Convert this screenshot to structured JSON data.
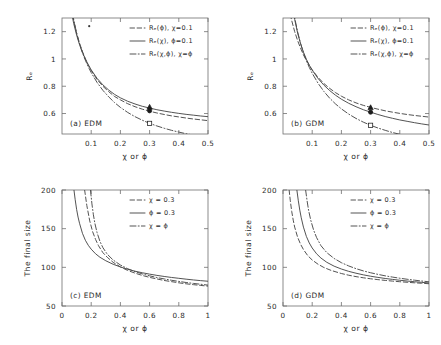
{
  "figure": {
    "layout": "2x2 grid of line plots",
    "panels": [
      "a",
      "b",
      "c",
      "d"
    ]
  },
  "chart_data": [
    {
      "type": "line",
      "panel": "a",
      "title": "(a) EDM",
      "xlabel": "χ or ϕ",
      "ylabel": "Rₑ",
      "xlim": [
        0,
        0.5
      ],
      "ylim": [
        0.45,
        1.3
      ],
      "xticks": [
        0.1,
        0.2,
        0.3,
        0.4,
        0.5
      ],
      "xtick_labels": [
        "0.1",
        "0.2",
        "0.3",
        "0.4",
        "0.5"
      ],
      "yticks": [
        0.6,
        0.8,
        1,
        1.2
      ],
      "ytick_labels": [
        "0.6",
        "0.8",
        "1",
        "1.2"
      ],
      "grid": false,
      "legend_position": "upper right",
      "series": [
        {
          "name": "Rₑ(ϕ), χ=0.1",
          "style": "dashed",
          "x": [
            0.01,
            0.02,
            0.03,
            0.04,
            0.05,
            0.06,
            0.07,
            0.08,
            0.09,
            0.1,
            0.12,
            0.14,
            0.16,
            0.18,
            0.2,
            0.225,
            0.25,
            0.275,
            0.3,
            0.325,
            0.35,
            0.375,
            0.4,
            0.425,
            0.45,
            0.475,
            0.5
          ],
          "y": [
            1.78,
            1.56,
            1.4,
            1.28,
            1.19,
            1.115,
            1.055,
            1.0,
            0.955,
            0.915,
            0.85,
            0.8,
            0.76,
            0.725,
            0.7,
            0.672,
            0.65,
            0.632,
            0.617,
            0.604,
            0.593,
            0.583,
            0.575,
            0.567,
            0.56,
            0.554,
            0.548
          ]
        },
        {
          "name": "Rₑ(χ), ϕ=0.1",
          "style": "solid",
          "x": [
            0.01,
            0.02,
            0.03,
            0.04,
            0.05,
            0.06,
            0.07,
            0.08,
            0.09,
            0.1,
            0.12,
            0.14,
            0.16,
            0.18,
            0.2,
            0.225,
            0.25,
            0.275,
            0.3,
            0.325,
            0.35,
            0.375,
            0.4,
            0.425,
            0.45,
            0.475,
            0.5
          ],
          "y": [
            1.72,
            1.52,
            1.37,
            1.26,
            1.175,
            1.105,
            1.048,
            1.0,
            0.958,
            0.92,
            0.858,
            0.81,
            0.772,
            0.74,
            0.715,
            0.69,
            0.67,
            0.653,
            0.64,
            0.628,
            0.618,
            0.609,
            0.601,
            0.594,
            0.588,
            0.582,
            0.577
          ]
        },
        {
          "name": "Rₑ(χ,ϕ), χ=ϕ",
          "style": "dashdot",
          "x": [
            0.01,
            0.02,
            0.03,
            0.04,
            0.05,
            0.06,
            0.07,
            0.08,
            0.09,
            0.1,
            0.12,
            0.14,
            0.16,
            0.18,
            0.2,
            0.225,
            0.25,
            0.275,
            0.3,
            0.325,
            0.35,
            0.375,
            0.4,
            0.425,
            0.45,
            0.475,
            0.5
          ],
          "y": [
            1.83,
            1.59,
            1.42,
            1.29,
            1.19,
            1.11,
            1.045,
            0.99,
            0.942,
            0.9,
            0.828,
            0.77,
            0.722,
            0.68,
            0.645,
            0.608,
            0.577,
            0.551,
            0.528,
            0.509,
            0.492,
            0.477,
            0.464,
            0.452,
            0.442,
            0.433,
            0.424
          ]
        }
      ],
      "markers": [
        {
          "shape": "triangle",
          "fill": "filled",
          "x": 0.3,
          "y": 0.648
        },
        {
          "shape": "circle",
          "fill": "filled",
          "x": 0.3,
          "y": 0.62
        },
        {
          "shape": "square",
          "fill": "open",
          "x": 0.3,
          "y": 0.528
        }
      ]
    },
    {
      "type": "line",
      "panel": "b",
      "title": "(b) GDM",
      "xlabel": "χ or ϕ",
      "ylabel": "Rₑ",
      "xlim": [
        0,
        0.5
      ],
      "ylim": [
        0.45,
        1.3
      ],
      "xticks": [
        0.1,
        0.2,
        0.3,
        0.4,
        0.5
      ],
      "xtick_labels": [
        "0.1",
        "0.2",
        "0.3",
        "0.4",
        "0.5"
      ],
      "yticks": [
        0.6,
        0.8,
        1,
        1.2
      ],
      "ytick_labels": [
        "0.6",
        "0.8",
        "1",
        "1.2"
      ],
      "grid": false,
      "legend_position": "upper right",
      "series": [
        {
          "name": "Rₑ(ϕ), χ=0.1",
          "style": "dashed",
          "x": [
            0.01,
            0.02,
            0.03,
            0.04,
            0.05,
            0.06,
            0.07,
            0.08,
            0.09,
            0.1,
            0.12,
            0.14,
            0.16,
            0.18,
            0.2,
            0.225,
            0.25,
            0.275,
            0.3,
            0.325,
            0.35,
            0.375,
            0.4,
            0.425,
            0.45,
            0.475,
            0.5
          ],
          "y": [
            1.48,
            1.37,
            1.28,
            1.2,
            1.135,
            1.08,
            1.03,
            0.99,
            0.952,
            0.92,
            0.865,
            0.82,
            0.784,
            0.753,
            0.727,
            0.7,
            0.678,
            0.66,
            0.645,
            0.632,
            0.62,
            0.61,
            0.601,
            0.593,
            0.586,
            0.58,
            0.574
          ]
        },
        {
          "name": "Rₑ(χ), ϕ=0.1",
          "style": "solid",
          "x": [
            0.01,
            0.02,
            0.03,
            0.04,
            0.05,
            0.06,
            0.07,
            0.08,
            0.09,
            0.1,
            0.12,
            0.14,
            0.16,
            0.18,
            0.2,
            0.225,
            0.25,
            0.275,
            0.3,
            0.325,
            0.35,
            0.375,
            0.4,
            0.425,
            0.45,
            0.475,
            0.5
          ],
          "y": [
            1.85,
            1.6,
            1.42,
            1.29,
            1.19,
            1.113,
            1.05,
            0.998,
            0.955,
            0.918,
            0.857,
            0.808,
            0.768,
            0.734,
            0.705,
            0.675,
            0.65,
            0.628,
            0.61,
            0.593,
            0.578,
            0.565,
            0.553,
            0.543,
            0.533,
            0.524,
            0.516
          ]
        },
        {
          "name": "Rₑ(χ,ϕ), χ=ϕ",
          "style": "dashdot",
          "x": [
            0.01,
            0.02,
            0.03,
            0.04,
            0.05,
            0.06,
            0.07,
            0.08,
            0.09,
            0.1,
            0.12,
            0.14,
            0.16,
            0.18,
            0.2,
            0.225,
            0.25,
            0.275,
            0.3,
            0.325,
            0.35,
            0.375,
            0.4,
            0.425,
            0.45,
            0.475,
            0.5
          ],
          "y": [
            1.86,
            1.61,
            1.43,
            1.3,
            1.2,
            1.115,
            1.045,
            0.988,
            0.938,
            0.895,
            0.822,
            0.762,
            0.712,
            0.67,
            0.634,
            0.596,
            0.564,
            0.537,
            0.514,
            0.494,
            0.477,
            0.461,
            0.448,
            0.436,
            0.425,
            0.416,
            0.407
          ]
        }
      ],
      "markers": [
        {
          "shape": "triangle",
          "fill": "filled",
          "x": 0.3,
          "y": 0.645
        },
        {
          "shape": "circle",
          "fill": "filled",
          "x": 0.3,
          "y": 0.61
        },
        {
          "shape": "square",
          "fill": "open",
          "x": 0.3,
          "y": 0.514
        }
      ]
    },
    {
      "type": "line",
      "panel": "c",
      "title": "(c) EDM",
      "xlabel": "χ or ϕ",
      "ylabel": "The final size",
      "xlim": [
        0,
        1
      ],
      "ylim": [
        50,
        200
      ],
      "xticks": [
        0,
        0.2,
        0.4,
        0.6,
        0.8,
        1
      ],
      "xtick_labels": [
        "0",
        "0.2",
        "0.4",
        "0.6",
        "0.8",
        "1"
      ],
      "yticks": [
        50,
        100,
        150,
        200
      ],
      "ytick_labels": [
        "50",
        "100",
        "150",
        "200"
      ],
      "grid": false,
      "legend_position": "upper right",
      "series": [
        {
          "name": "χ = 0.3",
          "style": "dashed",
          "x": [
            0.155,
            0.17,
            0.19,
            0.21,
            0.23,
            0.25,
            0.28,
            0.31,
            0.35,
            0.4,
            0.45,
            0.5,
            0.55,
            0.6,
            0.65,
            0.7,
            0.75,
            0.8,
            0.85,
            0.9,
            0.95,
            1.0
          ],
          "y": [
            200,
            180,
            160,
            146,
            136,
            128,
            119,
            113,
            106.5,
            100.5,
            96,
            92.5,
            89.5,
            87,
            85,
            83,
            81.5,
            80,
            78.7,
            77.6,
            76.6,
            75.7
          ]
        },
        {
          "name": "ϕ = 0.3",
          "style": "solid",
          "x": [
            0.082,
            0.09,
            0.1,
            0.11,
            0.12,
            0.14,
            0.16,
            0.18,
            0.2,
            0.23,
            0.26,
            0.3,
            0.35,
            0.4,
            0.45,
            0.5,
            0.55,
            0.6,
            0.65,
            0.7,
            0.75,
            0.8,
            0.85,
            0.9,
            0.95,
            1.0
          ],
          "y": [
            200,
            188,
            175,
            165,
            157,
            144,
            135,
            128.5,
            123.5,
            117.5,
            113,
            108.5,
            104,
            100.5,
            97.5,
            95,
            93,
            91.2,
            89.6,
            88.2,
            86.9,
            85.8,
            84.7,
            83.7,
            82.8,
            82
          ]
        },
        {
          "name": "χ = ϕ",
          "style": "dashdot",
          "x": [
            0.195,
            0.205,
            0.215,
            0.225,
            0.24,
            0.26,
            0.28,
            0.31,
            0.35,
            0.4,
            0.45,
            0.5,
            0.55,
            0.6,
            0.65,
            0.7,
            0.75,
            0.8,
            0.85,
            0.9,
            0.95,
            1.0
          ],
          "y": [
            200,
            182,
            168,
            157,
            145,
            133.5,
            125.5,
            117,
            109.5,
            103,
            98.2,
            94.5,
            91.5,
            89,
            86.8,
            85,
            83.3,
            81.8,
            80.4,
            79.2,
            78.1,
            77
          ]
        }
      ]
    },
    {
      "type": "line",
      "panel": "d",
      "title": "(d) GDM",
      "xlabel": "χ or ϕ",
      "ylabel": "The final size",
      "xlim": [
        0,
        1
      ],
      "ylim": [
        50,
        200
      ],
      "xticks": [
        0,
        0.2,
        0.4,
        0.6,
        0.8,
        1
      ],
      "xtick_labels": [
        "0",
        "0.2",
        "0.4",
        "0.6",
        "0.8",
        "1"
      ],
      "yticks": [
        50,
        100,
        150,
        200
      ],
      "ytick_labels": [
        "50",
        "100",
        "150",
        "200"
      ],
      "grid": false,
      "legend_position": "upper right",
      "series": [
        {
          "name": "χ = 0.3",
          "style": "dashed",
          "x": [
            0.042,
            0.05,
            0.06,
            0.07,
            0.08,
            0.1,
            0.12,
            0.14,
            0.17,
            0.2,
            0.24,
            0.28,
            0.33,
            0.4,
            0.45,
            0.5,
            0.55,
            0.6,
            0.65,
            0.7,
            0.75,
            0.8,
            0.85,
            0.9,
            0.95,
            1.0
          ],
          "y": [
            200,
            186,
            172,
            161,
            152,
            139,
            130,
            123,
            115,
            109.5,
            104,
            99.8,
            96,
            92,
            89.8,
            88,
            86.5,
            85.2,
            84.1,
            83.1,
            82.2,
            81.4,
            80.7,
            80,
            79.4,
            78.8
          ]
        },
        {
          "name": "ϕ = 0.3",
          "style": "solid",
          "x": [
            0.095,
            0.105,
            0.115,
            0.125,
            0.14,
            0.16,
            0.18,
            0.2,
            0.23,
            0.26,
            0.3,
            0.35,
            0.4,
            0.45,
            0.5,
            0.55,
            0.6,
            0.65,
            0.7,
            0.75,
            0.8,
            0.85,
            0.9,
            0.95,
            1.0
          ],
          "y": [
            200,
            186,
            174,
            164,
            152,
            140,
            131.5,
            125,
            117.5,
            112,
            106.5,
            101.5,
            97.8,
            94.8,
            92.4,
            90.3,
            88.5,
            87,
            85.6,
            84.4,
            83.3,
            82.3,
            81.4,
            80.6,
            79.8
          ]
        },
        {
          "name": "χ = ϕ",
          "style": "dashdot",
          "x": [
            0.155,
            0.165,
            0.175,
            0.19,
            0.21,
            0.23,
            0.26,
            0.3,
            0.35,
            0.4,
            0.45,
            0.5,
            0.55,
            0.6,
            0.65,
            0.7,
            0.75,
            0.8,
            0.85,
            0.9,
            0.95,
            1.0
          ],
          "y": [
            200,
            186,
            174,
            161,
            148,
            138.5,
            128,
            119,
            111.5,
            106,
            101.8,
            98.3,
            95.4,
            93,
            90.9,
            89,
            87.4,
            85.9,
            84.6,
            83.4,
            82.3,
            81.3
          ]
        }
      ]
    }
  ]
}
